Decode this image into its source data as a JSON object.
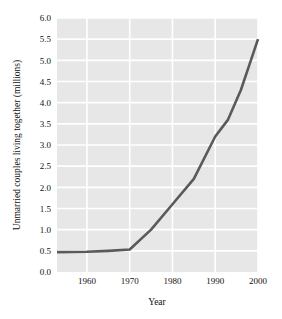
{
  "chart_data": {
    "type": "line",
    "title": "",
    "xlabel": "Year",
    "ylabel": "Unmarried couples living together (millions)",
    "xlim": [
      1953,
      2000
    ],
    "ylim": [
      0.0,
      6.0
    ],
    "grid": true,
    "legend": "none",
    "plot_background": "#e7e7e7",
    "grid_color": "#ffffff",
    "line_color": "#5a5a5a",
    "line_width": 2.6,
    "x_ticks": [
      "1960",
      "1970",
      "1980",
      "1990",
      "2000"
    ],
    "x_tick_values": [
      1960,
      1970,
      1980,
      1990,
      2000
    ],
    "y_ticks": [
      "0.0",
      "0.5",
      "1.0",
      "1.5",
      "2.0",
      "2.5",
      "3.0",
      "3.5",
      "4.0",
      "4.5",
      "5.0",
      "5.5",
      "6.0"
    ],
    "y_tick_values": [
      0.0,
      0.5,
      1.0,
      1.5,
      2.0,
      2.5,
      3.0,
      3.5,
      4.0,
      4.5,
      5.0,
      5.5,
      6.0
    ],
    "series": [
      {
        "name": "Unmarried couples living together",
        "x": [
          1953,
          1960,
          1965,
          1970,
          1975,
          1980,
          1985,
          1990,
          1993,
          1996,
          1998,
          2000
        ],
        "values": [
          0.47,
          0.48,
          0.5,
          0.53,
          1.0,
          1.6,
          2.2,
          3.2,
          3.6,
          4.3,
          4.9,
          5.5
        ]
      }
    ]
  }
}
